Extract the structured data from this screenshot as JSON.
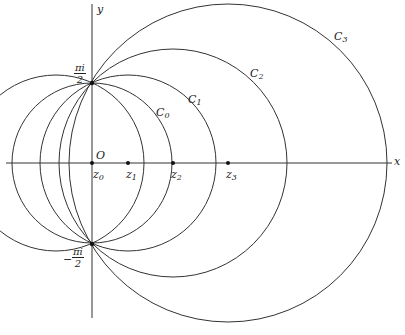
{
  "axes": {
    "x_label": "x",
    "y_label": "y",
    "origin_label": "O"
  },
  "special_points": {
    "top": {
      "num": "πi",
      "den": "2",
      "sign": ""
    },
    "bottom": {
      "num": "πi",
      "den": "2",
      "sign": "−"
    }
  },
  "circles": [
    {
      "name": "C",
      "sub": "0",
      "center": "z0"
    },
    {
      "name": "C",
      "sub": "1",
      "center": "z1"
    },
    {
      "name": "C",
      "sub": "2",
      "center": "z2"
    },
    {
      "name": "C",
      "sub": "3",
      "center": "z3"
    }
  ],
  "centers": [
    {
      "name": "z",
      "sub": "0"
    },
    {
      "name": "z",
      "sub": "1"
    },
    {
      "name": "z",
      "sub": "2"
    },
    {
      "name": "z",
      "sub": "3"
    }
  ],
  "colors": {
    "stroke": "#333333"
  }
}
